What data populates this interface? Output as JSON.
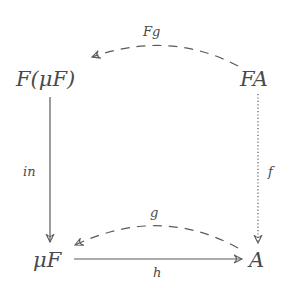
{
  "diagram": {
    "type": "commutative-diagram",
    "nodes": {
      "top_left": "F(μF)",
      "top_right": "FA",
      "bottom_left": "μF",
      "bottom_right": "A"
    },
    "arrows": [
      {
        "from": "FA",
        "to": "F(μF)",
        "label": "Fg",
        "style": "dashed-curved"
      },
      {
        "from": "F(μF)",
        "to": "μF",
        "label": "in",
        "style": "solid"
      },
      {
        "from": "FA",
        "to": "A",
        "label": "f",
        "style": "dotted"
      },
      {
        "from": "A",
        "to": "μF",
        "label": "g",
        "style": "dashed-curved"
      },
      {
        "from": "μF",
        "to": "A",
        "label": "h",
        "style": "solid"
      }
    ],
    "labels": {
      "fg": "Fg",
      "in": "in",
      "f": "f",
      "g": "g",
      "h": "h"
    }
  }
}
